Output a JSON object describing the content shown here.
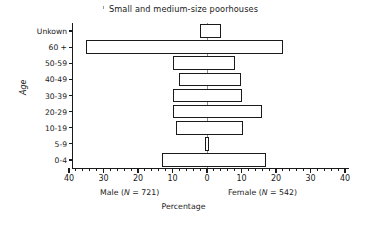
{
  "chart_data": {
    "type": "bar",
    "subtype": "population-pyramid",
    "title": "Small and medium-size poorhouses",
    "xlabel": "Percentage",
    "ylabel": "Age",
    "categories": [
      "0-4",
      "5-9",
      "10-19",
      "20-29",
      "30-39",
      "40-49",
      "50-59",
      "60 +",
      "Unkown"
    ],
    "axis_order_top_to_bottom": [
      "Unkown",
      "60 +",
      "50-59",
      "40-49",
      "30-39",
      "20-29",
      "10-19",
      "5-9",
      "0-4"
    ],
    "xlim": [
      -40,
      40
    ],
    "xticks": [
      40,
      30,
      20,
      10,
      0,
      10,
      20,
      30,
      40
    ],
    "xtick_labels": [
      "40",
      "30",
      "20",
      "10",
      "0",
      "10",
      "20",
      "30",
      "40"
    ],
    "minor_tick_interval": 2,
    "grid": false,
    "legend": "none",
    "series": [
      {
        "name": "Male",
        "side": "left",
        "caption": "Male (N = 721)",
        "n": 721,
        "values": [
          13,
          0.5,
          9,
          10,
          10,
          8,
          10,
          35,
          2
        ]
      },
      {
        "name": "Female",
        "side": "right",
        "caption": "Female (N = 542)",
        "n": 542,
        "values": [
          17,
          0.5,
          10.5,
          16,
          10,
          10,
          8,
          22,
          4
        ]
      }
    ],
    "colors": {
      "bar_fill": "#ffffff",
      "bar_stroke": "#1a1a1a",
      "axis": "#1a1a1a",
      "center_line": "#8d8d8d",
      "text": "#1a1a1a"
    }
  },
  "captions": {
    "male": "Male (N = 721)",
    "male_plain": "Male (",
    "male_italic_n": "N",
    "male_tail": " = 721)",
    "female_plain": "Female (",
    "female_italic_n": "N",
    "female_tail": " = 542)",
    "percentage": "Percentage",
    "age": "Age"
  }
}
